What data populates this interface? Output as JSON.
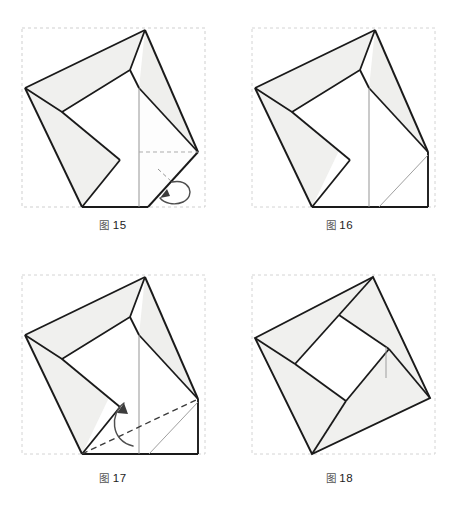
{
  "document": {
    "type": "origami-folding-diagram",
    "title": "Origami folding steps 15-18",
    "background_color": "#ffffff",
    "paper_fill_color": "#f2f2f0",
    "paper_fill_color_alt": "#ffffff",
    "line_color": "#1a1a1a",
    "thin_line_color": "#8a8a8a",
    "guide_color": "#bdbdbd",
    "arrow_color": "#4a4a4a"
  },
  "panels": [
    {
      "id": "panel-15",
      "caption": {
        "prefix": "图",
        "number": "15"
      },
      "caption_text": "图 15",
      "step_number": 15,
      "annotations": {
        "fold_type": "fold-behind",
        "has_curved_arrow": true,
        "arrow_direction": "wrap-around-back",
        "has_dashed_guide": true
      }
    },
    {
      "id": "panel-16",
      "caption": {
        "prefix": "图",
        "number": "16"
      },
      "caption_text": "图 16",
      "step_number": 16,
      "annotations": {
        "fold_type": "result",
        "has_curved_arrow": false,
        "arrow_direction": "",
        "has_dashed_guide": false
      }
    },
    {
      "id": "panel-17",
      "caption": {
        "prefix": "图",
        "number": "17"
      },
      "caption_text": "图 17",
      "step_number": 17,
      "annotations": {
        "fold_type": "valley-fold",
        "has_curved_arrow": true,
        "arrow_direction": "upward",
        "has_dashed_guide": true
      }
    },
    {
      "id": "panel-18",
      "caption": {
        "prefix": "图",
        "number": "18"
      },
      "caption_text": "图 18",
      "step_number": 18,
      "annotations": {
        "fold_type": "result",
        "has_curved_arrow": false,
        "arrow_direction": "",
        "has_dashed_guide": false
      }
    }
  ]
}
